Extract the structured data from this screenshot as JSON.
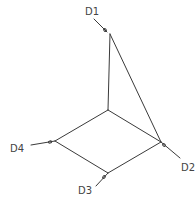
{
  "diagram": {
    "type": "wireframe-3d-frame",
    "line_color": "#3a3a3a",
    "label_color": "#444444",
    "background": "#ffffff",
    "nodes": {
      "top": {
        "x": 110,
        "y": 34
      },
      "center": {
        "x": 108,
        "y": 110
      },
      "right": {
        "x": 161,
        "y": 142
      },
      "bottom": {
        "x": 108,
        "y": 173
      },
      "left": {
        "x": 55,
        "y": 141
      }
    },
    "edges": [
      [
        "top",
        "center"
      ],
      [
        "top",
        "right"
      ],
      [
        "center",
        "right"
      ],
      [
        "center",
        "left"
      ],
      [
        "left",
        "bottom"
      ],
      [
        "bottom",
        "right"
      ]
    ],
    "labels": [
      {
        "id": "D1",
        "text": "D1",
        "node": "top"
      },
      {
        "id": "D2",
        "text": "D2",
        "node": "right"
      },
      {
        "id": "D3",
        "text": "D3",
        "node": "bottom"
      },
      {
        "id": "D4",
        "text": "D4",
        "node": "left"
      }
    ]
  }
}
